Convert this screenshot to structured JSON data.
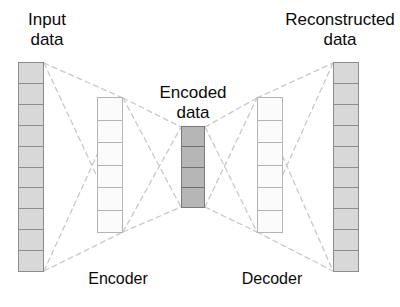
{
  "diagram": {
    "background_color": "#ffffff",
    "link_color": "#c9c9c9",
    "labels": {
      "input": "Input\ndata",
      "encoded": "Encoded\ndata",
      "reconstructed": "Reconstructed\ndata",
      "encoder": "Encoder",
      "decoder": "Decoder"
    },
    "layers": [
      {
        "name": "input-layer",
        "label": "Input data",
        "units": 10,
        "fill_color": "#d8d8d8",
        "border_color": "#8d8d8d",
        "x": 18,
        "y": 62,
        "width": 26,
        "height": 210
      },
      {
        "name": "encoder-hidden-layer",
        "label": "Encoder hidden",
        "units": 6,
        "fill_color": "#fbfbfb",
        "border_color": "#b4b4b4",
        "x": 97,
        "y": 97,
        "width": 26,
        "height": 136
      },
      {
        "name": "encoded-layer",
        "label": "Encoded data",
        "units": 4,
        "fill_color": "#b6b6b6",
        "border_color": "#7a7a7a",
        "x": 181,
        "y": 126,
        "width": 24,
        "height": 82
      },
      {
        "name": "decoder-hidden-layer",
        "label": "Decoder hidden",
        "units": 6,
        "fill_color": "#fbfbfb",
        "border_color": "#b4b4b4",
        "x": 257,
        "y": 97,
        "width": 26,
        "height": 136
      },
      {
        "name": "output-layer",
        "label": "Reconstructed data",
        "units": 10,
        "fill_color": "#d8d8d8",
        "border_color": "#8d8d8d",
        "x": 333,
        "y": 62,
        "width": 26,
        "height": 210
      }
    ],
    "connections": [
      {
        "from": "input-layer",
        "to": "encoder-hidden-layer",
        "style": "dashed",
        "shape": "cross"
      },
      {
        "from": "encoder-hidden-layer",
        "to": "encoded-layer",
        "style": "dashed",
        "shape": "cross"
      },
      {
        "from": "encoded-layer",
        "to": "decoder-hidden-layer",
        "style": "dashed",
        "shape": "cross"
      },
      {
        "from": "decoder-hidden-layer",
        "to": "output-layer",
        "style": "dashed",
        "shape": "cross"
      }
    ]
  }
}
